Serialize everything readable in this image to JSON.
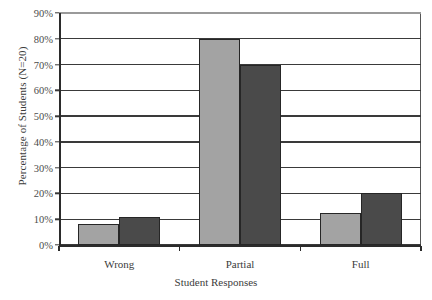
{
  "chart_data": {
    "type": "bar",
    "title": "",
    "xlabel": "Student Responses",
    "ylabel": "Percentage of Students (N=20)",
    "categories": [
      "Wrong",
      "Partial",
      "Full"
    ],
    "series": [
      {
        "name": "Series 1",
        "color": "#a3a3a3",
        "values": [
          8,
          80,
          12.5
        ]
      },
      {
        "name": "Series 2",
        "color": "#4a4a4a",
        "values": [
          11,
          70,
          20
        ]
      }
    ],
    "ylim": [
      0,
      90
    ],
    "ytick_labels": [
      "0%",
      "10%",
      "20%",
      "30%",
      "40%",
      "50%",
      "60%",
      "70%",
      "80%",
      "90%"
    ],
    "ytick_values": [
      0,
      10,
      20,
      30,
      40,
      50,
      60,
      70,
      80,
      90
    ],
    "grid": true,
    "legend": "none",
    "bar_border_color": "#262626",
    "axis_color": "#2b2b2b"
  }
}
